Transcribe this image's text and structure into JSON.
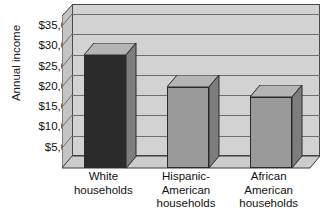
{
  "chart_data": {
    "type": "bar",
    "title": "",
    "xlabel": "",
    "ylabel": "Annual income",
    "categories": [
      "White households",
      "Hispanic-American households",
      "African American households"
    ],
    "category_lines": [
      [
        "White",
        "households"
      ],
      [
        "Hispanic-",
        "American",
        "households"
      ],
      [
        "African",
        "American",
        "households"
      ]
    ],
    "values": [
      28000,
      20000,
      17500
    ],
    "value_labels": [
      "$28,000",
      "$20,000",
      "$17,500"
    ],
    "ylim": [
      0,
      37500
    ],
    "ytick_values": [
      35000,
      30000,
      25000,
      20000,
      15000,
      10000,
      5000
    ],
    "ytick_labels": [
      "$35,000",
      "$30,000",
      "$25,000",
      "$20,000",
      "$15,000",
      "$10,000",
      "$5,000"
    ],
    "grid": true,
    "legend": false,
    "legend_position": "none",
    "three_d": true,
    "bar_colors": [
      "#2b2b2b",
      "#9a9a9a",
      "#9a9a9a"
    ],
    "plot_background": "#d2d2d2"
  },
  "axis": {
    "y_title": "Annual income"
  }
}
